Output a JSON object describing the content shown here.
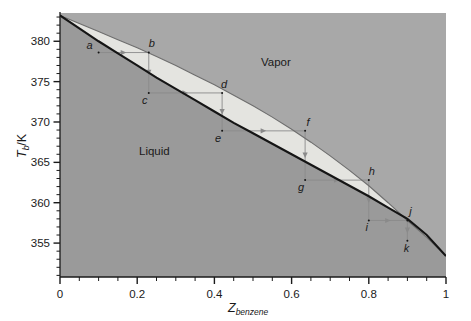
{
  "figure": {
    "title": "",
    "axis": {
      "ylabel_main": "T",
      "ylabel_sub": "b",
      "ylabel_unit": "/K",
      "xlabel_main": "Z",
      "xlabel_sub": "benzene"
    },
    "region_labels": {
      "vapor": "Vapor",
      "liquid": "Liquid"
    },
    "colors": {
      "vapor_fill": "#a8a8a8",
      "liquid_fill": "#9a9a9a",
      "two_phase_fill": "#e4e4e0",
      "bubble_curve": "#151515",
      "dew_curve": "#6e6e6e",
      "tie_line": "#8a8a8a",
      "axis": "#1a1a1a",
      "background": "#ffffff"
    }
  },
  "chart_data": {
    "type": "line",
    "title": "",
    "xlabel": "Z_benzene",
    "ylabel": "T_b/K",
    "xlim": [
      0,
      1
    ],
    "ylim": [
      350.8,
      383.5
    ],
    "xticks": [
      0,
      0.2,
      0.4,
      0.6,
      0.8,
      1
    ],
    "xtick_labels": [
      "0",
      "0.2",
      "0.4",
      "0.6",
      "0.8",
      "1"
    ],
    "xtick_minor_step": 0.05,
    "yticks": [
      355,
      360,
      365,
      370,
      375,
      380
    ],
    "ytick_labels": [
      "355",
      "360",
      "365",
      "370",
      "375",
      "380"
    ],
    "ytick_minor_step": 1,
    "grid": false,
    "legend": null,
    "series": [
      {
        "name": "Liquid (bubble-point) curve",
        "style": "bold-black",
        "x": [
          0.0,
          0.05,
          0.1,
          0.15,
          0.2,
          0.25,
          0.3,
          0.35,
          0.4,
          0.45,
          0.5,
          0.55,
          0.6,
          0.65,
          0.7,
          0.75,
          0.8,
          0.85,
          0.9,
          0.95,
          1.0
        ],
        "y": [
          383.2,
          381.6,
          380.0,
          378.5,
          377.0,
          375.5,
          374.1,
          372.7,
          371.3,
          369.9,
          368.6,
          367.3,
          366.0,
          364.7,
          363.4,
          362.1,
          360.8,
          359.4,
          358.0,
          356.0,
          353.4
        ]
      },
      {
        "name": "Vapor (dew-point) curve",
        "style": "thin-gray",
        "x": [
          0.0,
          0.05,
          0.1,
          0.15,
          0.2,
          0.25,
          0.3,
          0.35,
          0.4,
          0.45,
          0.5,
          0.55,
          0.6,
          0.65,
          0.7,
          0.75,
          0.8,
          0.85,
          0.9,
          0.95,
          1.0
        ],
        "y": [
          383.2,
          382.2,
          381.2,
          380.2,
          379.2,
          378.1,
          377.0,
          375.8,
          374.6,
          373.3,
          372.0,
          370.6,
          369.1,
          367.5,
          365.8,
          364.0,
          362.1,
          360.0,
          357.8,
          355.7,
          353.4
        ]
      }
    ],
    "annotations": [
      {
        "label": "a",
        "x": 0.1,
        "y": 378.6,
        "label_dx": -9,
        "label_dy": -4
      },
      {
        "label": "b",
        "x": 0.23,
        "y": 378.6,
        "label_dx": 3,
        "label_dy": -6
      },
      {
        "label": "c",
        "x": 0.23,
        "y": 373.6,
        "label_dx": -4,
        "label_dy": 11
      },
      {
        "label": "d",
        "x": 0.42,
        "y": 373.6,
        "label_dx": 2,
        "label_dy": -5
      },
      {
        "label": "e",
        "x": 0.42,
        "y": 368.9,
        "label_dx": -4,
        "label_dy": 11
      },
      {
        "label": "f",
        "x": 0.635,
        "y": 368.9,
        "label_dx": 3,
        "label_dy": -5
      },
      {
        "label": "g",
        "x": 0.635,
        "y": 362.8,
        "label_dx": -4,
        "label_dy": 11
      },
      {
        "label": "h",
        "x": 0.8,
        "y": 362.8,
        "label_dx": 3,
        "label_dy": -5
      },
      {
        "label": "i",
        "x": 0.8,
        "y": 357.8,
        "label_dx": -2,
        "label_dy": 11
      },
      {
        "label": "j",
        "x": 0.9,
        "y": 357.8,
        "label_dx": 3,
        "label_dy": -5
      },
      {
        "label": "k",
        "x": 0.9,
        "y": 355.3,
        "label_dx": -1,
        "label_dy": 11
      }
    ],
    "tie_lines": [
      {
        "from": "a",
        "to": "b",
        "orientation": "horizontal",
        "arrow": true
      },
      {
        "from": "b",
        "to": "c",
        "orientation": "vertical",
        "arrow": true
      },
      {
        "from": "c",
        "to": "d",
        "orientation": "horizontal",
        "arrow": true
      },
      {
        "from": "d",
        "to": "e",
        "orientation": "vertical",
        "arrow": true
      },
      {
        "from": "e",
        "to": "f",
        "orientation": "horizontal",
        "arrow": true
      },
      {
        "from": "f",
        "to": "g",
        "orientation": "vertical",
        "arrow": true
      },
      {
        "from": "g",
        "to": "h",
        "orientation": "horizontal",
        "arrow": true
      },
      {
        "from": "h",
        "to": "i",
        "orientation": "vertical",
        "arrow": true
      },
      {
        "from": "i",
        "to": "j",
        "orientation": "horizontal",
        "arrow": true
      },
      {
        "from": "j",
        "to": "k",
        "orientation": "vertical",
        "arrow": true
      }
    ]
  }
}
